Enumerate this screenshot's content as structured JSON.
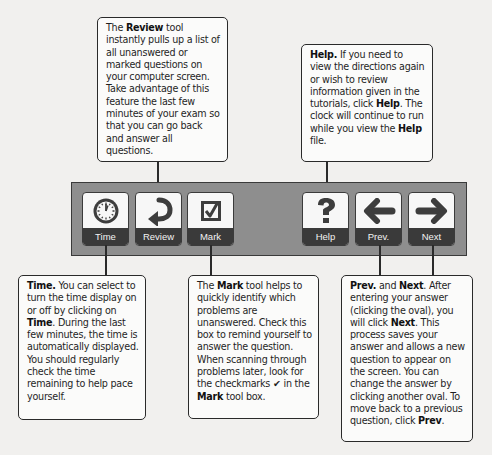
{
  "callouts": {
    "review": {
      "pre": "The ",
      "bold1": "Review",
      "post": " tool instantly pulls up a list of all unanswered or marked questions on your computer screen. Take advantage of this feature the last few minutes of your exam so that you can go back and answer all questions."
    },
    "help": {
      "bold1": "Help.",
      "mid1": " If you need to view the directions again or wish to review information given in the tutorials, click ",
      "bold2": "Help",
      "mid2": ". The clock will continue to run while you view the ",
      "bold3": "Help",
      "post": " file."
    },
    "time": {
      "bold1": "Time.",
      "mid1": " You can select to turn the time display on or off by clicking on ",
      "bold2": "Time",
      "post": ". During the last few minutes, the time is automatically displayed. You should regularly check the time remaining to help pace yourself."
    },
    "mark": {
      "pre": "The ",
      "bold1": "Mark",
      "mid1": " tool helps to quickly identify which problems are unanswered. Check this box to remind yourself to answer the question. When scanning through problems later, look for the checkmarks ✔ in the ",
      "bold2": "Mark",
      "post": " tool box."
    },
    "prevnext": {
      "bold1": "Prev.",
      "mid1": " and ",
      "bold2": "Next",
      "mid2": ". After entering your answer (clicking the oval), you will click ",
      "bold3": "Next",
      "mid3": ". This process saves your answer and allows a new question to appear on the screen. You can change the answer by clicking another oval. To move back to a previous question, click ",
      "bold4": "Prev",
      "post": "."
    }
  },
  "toolbar": {
    "buttons": [
      {
        "label": "Time",
        "icon": "clock-icon"
      },
      {
        "label": "Review",
        "icon": "return-arrow-icon"
      },
      {
        "label": "Mark",
        "icon": "checkbox-icon"
      },
      {
        "label": "Help",
        "icon": "question-mark-icon"
      },
      {
        "label": "Prev.",
        "icon": "left-arrow-icon"
      },
      {
        "label": "Next",
        "icon": "right-arrow-icon"
      }
    ]
  },
  "colors": {
    "toolbar_bg": "#8e8e8e",
    "button_label_bg": "#3a3a3a",
    "button_face": "#f7f7f7",
    "icon_dark": "#3d3d3d"
  }
}
